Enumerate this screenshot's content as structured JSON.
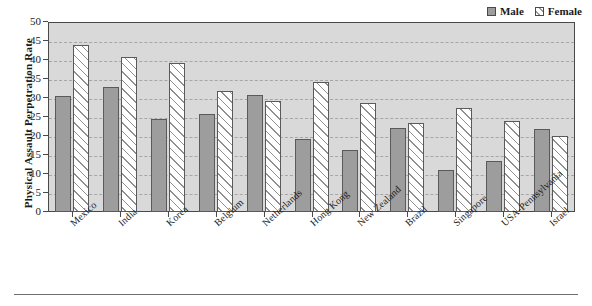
{
  "chart_data": {
    "type": "bar",
    "title": "",
    "xlabel": "",
    "ylabel": "Physical Assault Perpetration Rate",
    "ylim": [
      0,
      50
    ],
    "ytick_step": 5,
    "yticks": [
      0,
      5,
      10,
      15,
      20,
      25,
      30,
      35,
      40,
      45,
      50
    ],
    "grid": true,
    "legend_position": "top-right",
    "categories": [
      "Mexico",
      "India",
      "Korea",
      "Belgium",
      "Netherlands",
      "Hong Kong",
      "New Zealand",
      "Brazil",
      "Singapore",
      "USA-Pennsylvania",
      "Israel"
    ],
    "series": [
      {
        "name": "Male",
        "color": "#9d9d9d",
        "pattern": "solid-gray",
        "values": [
          30.5,
          32.9,
          24.5,
          25.7,
          30.7,
          19.3,
          16.3,
          22.1,
          11.1,
          13.5,
          21.9
        ]
      },
      {
        "name": "Female",
        "color": "#ffffff",
        "pattern": "diagonal-hatch",
        "values": [
          43.9,
          40.9,
          39.1,
          31.8,
          29.3,
          34.1,
          28.6,
          23.4,
          27.3,
          23.9,
          19.9
        ]
      }
    ]
  },
  "legend": {
    "items": [
      {
        "label": "Male",
        "swatch": "male-swatch"
      },
      {
        "label": "Female",
        "swatch": "female-swatch"
      }
    ]
  },
  "colors": {
    "plot_background": "#d9d9d9",
    "axis": "#4a4a4a",
    "gridline": "#a6a6a6",
    "male_bar": "#9d9d9d",
    "female_bar": "#ffffff",
    "page_background": "#ffffff"
  }
}
